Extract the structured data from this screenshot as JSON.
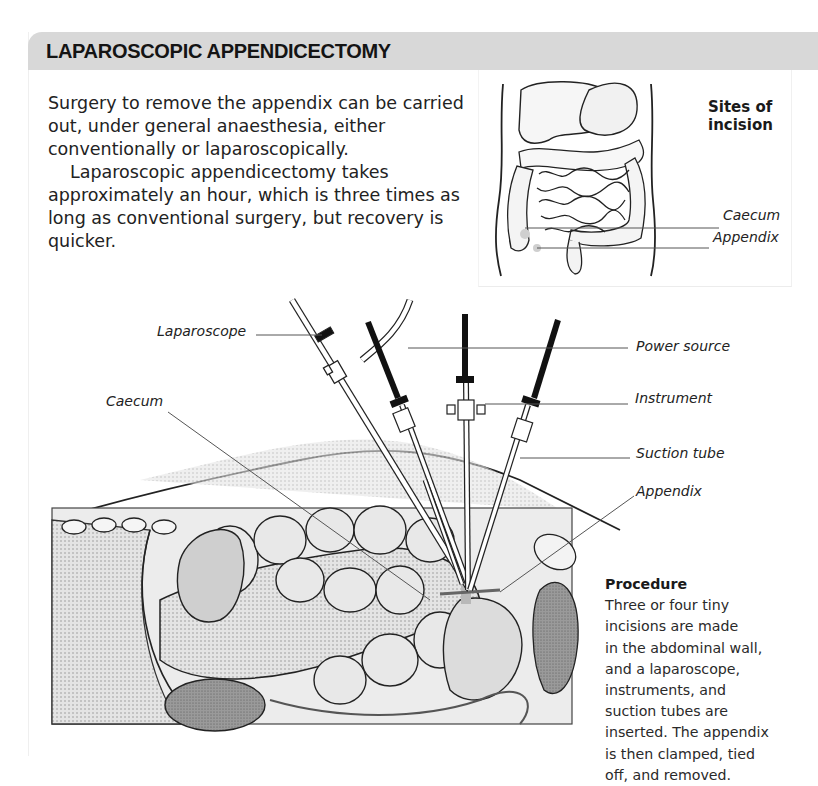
{
  "header": {
    "title": "LAPAROSCOPIC APPENDICECTOMY",
    "bar_color": "#d8d8d8"
  },
  "intro": {
    "paragraph1": "Surgery to remove the appendix can be carried out, under general anaesthesia, either conventionally or laparoscopically.",
    "paragraph2": "Laparoscopic appendicectomy takes approximately an hour, which is three times as long as conventional surgery, but recovery is quicker."
  },
  "inset_figure": {
    "title_line1": "Sites of",
    "title_line2": "incision",
    "labels": {
      "caecum": "Caecum",
      "appendix": "Appendix"
    }
  },
  "main_figure": {
    "labels": {
      "laparoscope": "Laparoscope",
      "caecum": "Caecum",
      "power_source": "Power source",
      "instrument": "Instrument",
      "suction_tube": "Suction tube",
      "appendix": "Appendix"
    }
  },
  "procedure": {
    "title": "Procedure",
    "text": "Three or four tiny\nincisions are made\nin the abdominal wall,\nand a laparoscope,\ninstruments, and\nsuction tubes are\ninserted. The appendix\nis then clamped, tied\noff, and removed."
  }
}
